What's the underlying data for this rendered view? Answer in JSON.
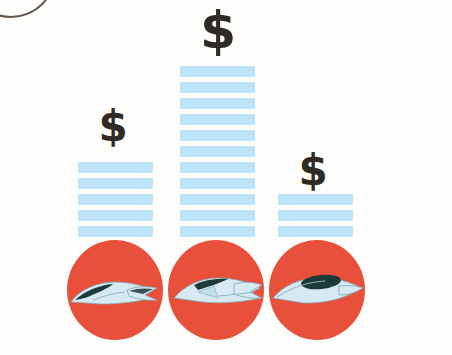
{
  "illustration": {
    "title": "Fish price bar chart illustration",
    "background_color": "#fdfdfb",
    "bar_color": "#bde5f7",
    "circle_color": "#e8503c",
    "dollar_color": "#2f2a23",
    "fish_body_color": "#d7e9f2",
    "fish_back_color": "#1d3a3a",
    "artifact": {
      "name": "page-curl-line",
      "color": "#4a3a2e"
    }
  },
  "chart_data": {
    "type": "bar",
    "title": "",
    "xlabel": "",
    "ylabel": "",
    "categories": [
      "fish-1",
      "fish-2",
      "fish-3"
    ],
    "values": [
      5,
      11,
      3
    ],
    "value_unit": "stripes",
    "data_labels": [
      "$",
      "$",
      "$"
    ],
    "label_sizes": [
      "medium",
      "large",
      "medium"
    ],
    "grid": false,
    "legend": null
  },
  "bars": [
    {
      "name": "bar-fish-1",
      "stripes": 5,
      "left": 78,
      "width": 75,
      "dollar": {
        "text": "$",
        "left": 92,
        "top": 106,
        "width": 42,
        "size": 42
      },
      "circle": {
        "name": "circle-fish-1",
        "left": 67,
        "top": 240
      }
    },
    {
      "name": "bar-fish-2",
      "stripes": 11,
      "left": 180,
      "width": 75,
      "dollar": {
        "text": "$",
        "left": 194,
        "top": 4,
        "width": 48,
        "size": 52
      },
      "circle": {
        "name": "circle-fish-2",
        "left": 168,
        "top": 240
      }
    },
    {
      "name": "bar-fish-3",
      "stripes": 3,
      "left": 278,
      "width": 75,
      "dollar": {
        "text": "$",
        "left": 292,
        "top": 150,
        "width": 42,
        "size": 42
      },
      "circle": {
        "name": "circle-fish-3",
        "left": 269,
        "top": 240
      }
    }
  ]
}
